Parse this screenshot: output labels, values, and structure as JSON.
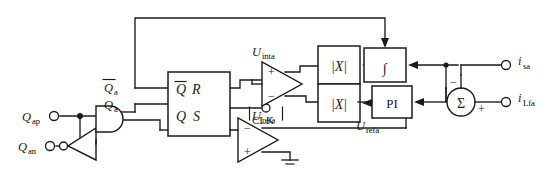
{
  "diagram": {
    "stroke_color": "#1b1b1b",
    "background_color": "#ffffff",
    "inputs": [
      {
        "id": "q-ap",
        "label": "Q",
        "subscript": "ap",
        "overbar": false
      },
      {
        "id": "q-an",
        "label": "Q",
        "subscript": "an",
        "overbar": false
      },
      {
        "id": "i-sa",
        "label": "i",
        "subscript": "sa",
        "overbar": false
      },
      {
        "id": "i-lfa",
        "label": "i",
        "subscript": "Lfa",
        "overbar": false
      }
    ],
    "internal_labels": [
      {
        "id": "q-a-bar",
        "label": "Q",
        "subscript": "a",
        "overbar": true
      },
      {
        "id": "q-a",
        "label": "Q",
        "subscript": "a",
        "overbar": false
      },
      {
        "id": "u-inta",
        "label": "U",
        "subscript": "inta",
        "overbar": false
      },
      {
        "id": "u-refa-abs",
        "label": "U",
        "subscript": "refa",
        "overbar": false,
        "absolute": true
      },
      {
        "id": "u-refa",
        "label": "U",
        "subscript": "refa",
        "overbar": false
      }
    ],
    "blocks": [
      {
        "id": "abs-top",
        "text": "|X|",
        "type": "absolute-value"
      },
      {
        "id": "abs-bottom",
        "text": "|X|",
        "type": "absolute-value"
      },
      {
        "id": "integrator",
        "text": "∫",
        "type": "integrator"
      },
      {
        "id": "pi-controller",
        "text": "PI",
        "type": "pi-controller"
      },
      {
        "id": "summer",
        "text": "Σ",
        "type": "summing-junction"
      }
    ],
    "flipflop": {
      "id": "sr-flipflop",
      "pins": [
        {
          "name": "Q",
          "overbar": true,
          "side": "left-top"
        },
        {
          "name": "R",
          "overbar": false,
          "side": "left-top"
        },
        {
          "name": "Q",
          "overbar": false,
          "side": "left-bottom"
        },
        {
          "name": "S",
          "overbar": false,
          "side": "left-bottom"
        }
      ]
    },
    "logic_gates": [
      {
        "id": "and-gate",
        "type": "AND"
      },
      {
        "id": "inverter",
        "type": "NOT"
      }
    ],
    "comparators": [
      {
        "id": "comparator-top",
        "plus_position": "top",
        "minus_position": "bottom"
      },
      {
        "id": "comparator-bottom",
        "plus_position": "bottom",
        "minus_position": "top"
      }
    ],
    "terminals": [
      {
        "id": "clk-terminal",
        "label": "CLK"
      }
    ],
    "summer_signs": [
      {
        "id": "summer-minus",
        "sign": "−",
        "position": "top"
      },
      {
        "id": "summer-plus",
        "sign": "+",
        "position": "right"
      }
    ],
    "comparator_signs": {
      "top_plus": "+",
      "top_minus": "−",
      "bottom_minus": "−",
      "bottom_plus": "+"
    },
    "clk_label": "CLK",
    "ground": {
      "id": "ground-symbol",
      "type": "earth"
    }
  }
}
